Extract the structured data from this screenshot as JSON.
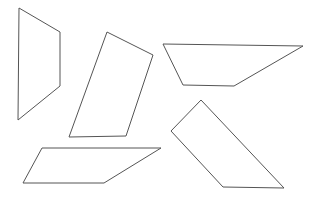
{
  "canvas": {
    "width": 315,
    "height": 199,
    "background": "#ffffff",
    "stroke": "#555555"
  },
  "shapes": [
    {
      "name": "quadrilateral-1",
      "points": "19,8 60,32 60,86 18,120"
    },
    {
      "name": "quadrilateral-2",
      "points": "107,32 153,55 126,136 69,137"
    },
    {
      "name": "quadrilateral-3",
      "points": "163,44 303,46 234,86 183,85"
    },
    {
      "name": "quadrilateral-4",
      "points": "42,148 161,148 104,183 23,183"
    },
    {
      "name": "quadrilateral-5",
      "points": "201,100 284,188 223,187 171,131"
    }
  ]
}
